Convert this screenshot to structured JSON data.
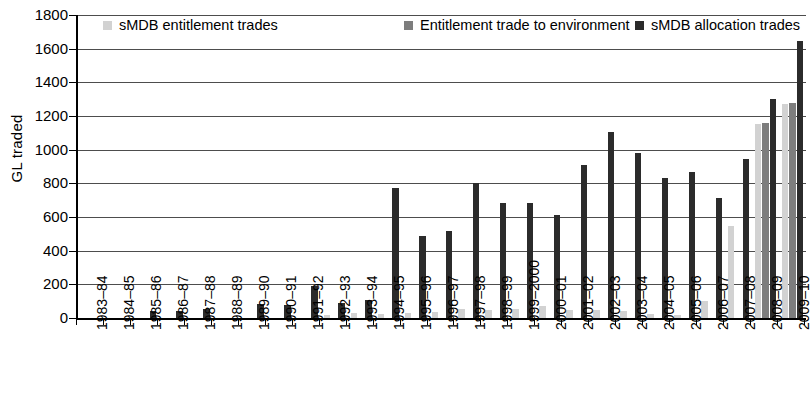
{
  "chart_data": {
    "type": "bar",
    "title": "",
    "xlabel": "",
    "ylabel": "GL traded",
    "ylim": [
      0,
      1800
    ],
    "yticks": [
      0,
      200,
      400,
      600,
      800,
      1000,
      1200,
      1400,
      1600,
      1800
    ],
    "grid": true,
    "legend_position": "top",
    "stacked": false,
    "categories": [
      "1983–84",
      "1984–85",
      "1985–86",
      "1986–87",
      "1987–88",
      "1988–89",
      "1989–90",
      "1990–91",
      "1991–92",
      "1992–93",
      "1993–94",
      "1994–95",
      "1995–96",
      "1996–97",
      "1997–98",
      "1998–99",
      "1999–2000",
      "2000–01",
      "2001–02",
      "2002–03",
      "2003–04",
      "2004–05",
      "2005–06",
      "2006–07",
      "2007–08",
      "2008–09",
      "2009–10"
    ],
    "series": [
      {
        "name": "sMDB entitlement trades",
        "color": "#d2d2d2",
        "values": [
          0,
          0,
          0,
          0,
          0,
          0,
          0,
          0,
          0,
          20,
          30,
          25,
          30,
          35,
          55,
          45,
          55,
          70,
          45,
          50,
          40,
          25,
          20,
          100,
          545,
          1155,
          1270
        ]
      },
      {
        "name": "Entitlement trade to environment",
        "color": "#7d7d7d",
        "values": [
          0,
          0,
          0,
          0,
          0,
          0,
          0,
          0,
          0,
          0,
          0,
          0,
          0,
          0,
          0,
          0,
          0,
          0,
          0,
          0,
          0,
          0,
          0,
          0,
          0,
          1160,
          1275
        ]
      },
      {
        "name": "sMDB allocation trades",
        "color": "#2b2b2b",
        "values": [
          0,
          0,
          40,
          40,
          55,
          0,
          85,
          80,
          190,
          90,
          105,
          775,
          490,
          515,
          800,
          685,
          685,
          610,
          910,
          1105,
          980,
          830,
          865,
          715,
          945,
          1300,
          1645
        ]
      }
    ]
  },
  "legend": {
    "items": [
      {
        "label": "sMDB entitlement trades",
        "color": "#d2d2d2",
        "icon": "square-swatch-icon"
      },
      {
        "label": "Entitlement trade to environment",
        "color": "#7d7d7d",
        "icon": "square-swatch-icon"
      },
      {
        "label": "sMDB allocation trades",
        "color": "#2b2b2b",
        "icon": "square-swatch-icon"
      }
    ]
  }
}
